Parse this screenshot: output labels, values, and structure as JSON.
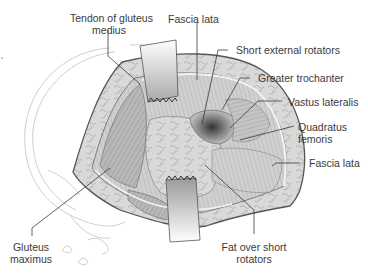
{
  "figure": {
    "colors": {
      "outline": "#555555",
      "skin_edge": "#6a6a6a",
      "fat": "#d6d6d6",
      "fat_pattern": "#9a9a9a",
      "muscle": "#b5b5b5",
      "muscle_dark": "#8a8a8a",
      "retractor": "#c8c8c8",
      "background_sketch": "#cfcfcf",
      "label_text": "#3a3a3a",
      "leader_line": "#3a3a3a"
    },
    "labels": {
      "tendon_gluteus_medius": {
        "line1": "Tendon of gluteus",
        "line2": "medius"
      },
      "fascia_lata_top": "Fascia lata",
      "short_external_rotators": "Short external rotators",
      "greater_trochanter": "Greater trochanter",
      "vastus_lateralis": "Vastus lateralis",
      "quadratus_femoris": {
        "line1": "Quadratus",
        "line2": "femoris"
      },
      "fascia_lata_right": "Fascia lata",
      "gluteus_maximus": {
        "line1": "Gluteus",
        "line2": "maximus"
      },
      "fat_over_short_rotators": {
        "line1": "Fat over short",
        "line2": "rotators"
      }
    }
  }
}
